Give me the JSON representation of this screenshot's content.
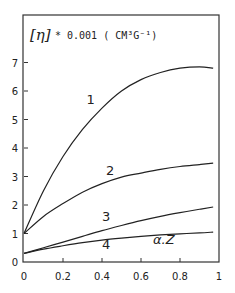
{
  "chart_data": {
    "type": "line",
    "title": "",
    "ylabel_symbol": "[η]",
    "ylabel_text": "* 0.001 ( CM³G⁻¹)",
    "xlabel": "",
    "annotation": "α.Z",
    "xlim": [
      0,
      1
    ],
    "ylim": [
      0,
      8
    ],
    "xticks": [
      "0",
      "0.2",
      "0.4",
      "0.6",
      "0.8",
      "1"
    ],
    "yticks": [
      "0",
      "1",
      "2",
      "3",
      "4",
      "5",
      "6",
      "7"
    ],
    "grid": false,
    "legend": "inline curve labels",
    "x": [
      0,
      0.1,
      0.2,
      0.3,
      0.4,
      0.5,
      0.6,
      0.7,
      0.8,
      0.9,
      0.97
    ],
    "series": [
      {
        "name": "1",
        "values": [
          1.0,
          2.5,
          3.7,
          4.65,
          5.4,
          6.0,
          6.4,
          6.65,
          6.8,
          6.85,
          6.8
        ]
      },
      {
        "name": "2",
        "values": [
          1.0,
          1.6,
          2.05,
          2.45,
          2.75,
          2.98,
          3.12,
          3.25,
          3.35,
          3.42,
          3.47
        ]
      },
      {
        "name": "3",
        "values": [
          0.3,
          0.5,
          0.7,
          0.9,
          1.1,
          1.28,
          1.45,
          1.6,
          1.73,
          1.85,
          1.93
        ]
      },
      {
        "name": "4",
        "values": [
          0.3,
          0.45,
          0.57,
          0.68,
          0.77,
          0.84,
          0.9,
          0.95,
          0.99,
          1.02,
          1.05
        ]
      }
    ]
  }
}
